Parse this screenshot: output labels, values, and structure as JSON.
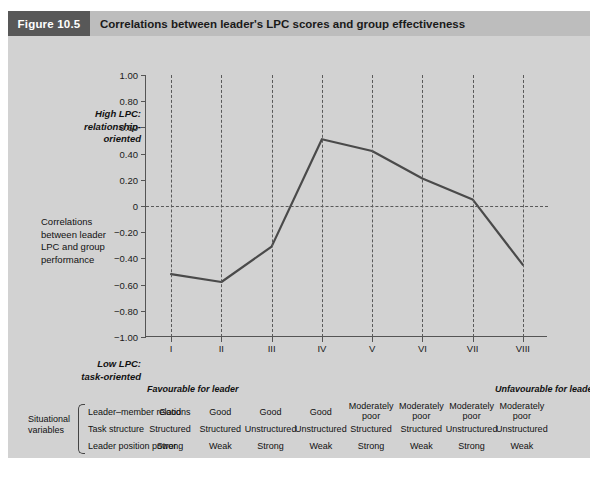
{
  "header": {
    "badge": "Figure 10.5",
    "title": "Correlations between leader's LPC scores and group effectiveness"
  },
  "annotations": {
    "high_lpc": "High LPC:\nrelationship-\noriented",
    "y_axis_label": "Correlations\nbetween leader\nLPC and group\nperformance",
    "low_lpc": "Low LPC:\ntask-oriented",
    "favourable": "Favourable for leader",
    "unfavourable": "Unfavourable for leader"
  },
  "situational": {
    "group_title": "Situational\nvariables",
    "rows": [
      {
        "label": "Leader–member relations",
        "values": [
          "Good",
          "Good",
          "Good",
          "Good",
          "Moderately\npoor",
          "Moderately\npoor",
          "Moderately\npoor",
          "Moderately\npoor"
        ]
      },
      {
        "label": "Task structure",
        "values": [
          "Structured",
          "Structured",
          "Unstructured",
          "Unstructured",
          "Structured",
          "Structured",
          "Unstructured",
          "Unstructured"
        ]
      },
      {
        "label": "Leader position power",
        "values": [
          "Strong",
          "Weak",
          "Strong",
          "Weak",
          "Strong",
          "Weak",
          "Strong",
          "Weak"
        ]
      }
    ]
  },
  "footnote": {
    "legend_icon": "line-swatch",
    "text": "= leadership style.   The appropriateness of leadership style for maximising group performance is dependent upon the three variables in the leadership situation."
  },
  "colors": {
    "badge_bg": "#585858",
    "header_bg": "#bdbdbd",
    "panel_bg": "#d2d2d2",
    "line": "#4a4a4a",
    "grid": "#5a5a5a",
    "axis": "#555555"
  },
  "chart_data": {
    "type": "line",
    "title": "Correlations between leader's LPC scores and group effectiveness",
    "xlabel": "",
    "ylabel": "Correlations between leader LPC and group performance",
    "categories": [
      "I",
      "II",
      "III",
      "IV",
      "V",
      "VI",
      "VII",
      "VIII"
    ],
    "values": [
      -0.52,
      -0.58,
      -0.31,
      0.51,
      0.42,
      0.21,
      0.05,
      -0.45
    ],
    "series": [
      {
        "name": "leadership style",
        "values": [
          -0.52,
          -0.58,
          -0.31,
          0.51,
          0.42,
          0.21,
          0.05,
          -0.45
        ]
      }
    ],
    "ylim": [
      -1.0,
      1.0
    ],
    "yticks": [
      1.0,
      0.8,
      0.6,
      0.4,
      0.2,
      0,
      -0.2,
      -0.4,
      -0.6,
      -0.8,
      -1.0
    ],
    "ytick_labels": [
      "1.00",
      "0.80",
      "0.60",
      "0.40",
      "0.20",
      "0",
      "−0.20",
      "−0.40",
      "−0.60",
      "−0.80",
      "−1.00"
    ],
    "grid": "vertical-dashed-at-each-category, horizontal-dashed-at-zero",
    "legend": "below-plot"
  }
}
